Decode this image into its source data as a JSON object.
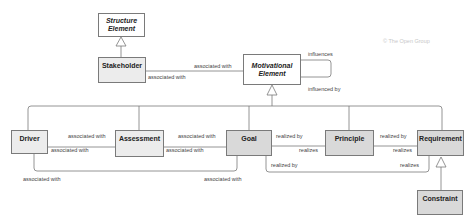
{
  "copyright": "© The Open Group",
  "elements": {
    "structure_element": {
      "label": "Structure Element",
      "style": "abstract"
    },
    "stakeholder": {
      "label": "Stakeholder",
      "style": "light"
    },
    "motivational_element": {
      "label": "Motivational Element",
      "style": "abstract"
    },
    "driver": {
      "label": "Driver",
      "style": "light"
    },
    "assessment": {
      "label": "Assessment",
      "style": "light"
    },
    "goal": {
      "label": "Goal",
      "style": "dark"
    },
    "principle": {
      "label": "Principle",
      "style": "dark"
    },
    "requirement": {
      "label": "Requirement",
      "style": "dark"
    },
    "constraint": {
      "label": "Constraint",
      "style": "dark"
    }
  },
  "relationships": {
    "stakeholder_to_motivational_top": "associated with",
    "stakeholder_to_motivational_bottom": "associated with",
    "motivational_self_influences": "influences",
    "motivational_self_influenced_by": "influenced by",
    "driver_assessment_top": "associated with",
    "driver_assessment_bottom": "associated with",
    "assessment_goal_top": "associated with",
    "assessment_goal_bottom": "associated with",
    "goal_principle_top": "realized by",
    "goal_principle_bottom": "realizes",
    "principle_requirement_top": "realized by",
    "principle_requirement_bottom": "realizes",
    "goal_requirement_left": "realized by",
    "goal_requirement_right": "realizes",
    "driver_goal_left": "associated with",
    "driver_goal_right": "associated with"
  },
  "colors": {
    "line": "#7a7a7a",
    "light_fill": "#ececec",
    "dark_fill": "#d9d9d9",
    "abstract_fill": "#ffffff"
  }
}
